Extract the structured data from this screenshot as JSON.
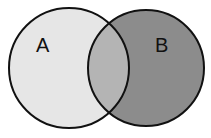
{
  "diagram": {
    "type": "venn",
    "sets": [
      {
        "label": "A",
        "fill": "#e6e6e6"
      },
      {
        "label": "B",
        "fill": "#8c8c8c"
      }
    ],
    "intersection_fill": "#b4b4b4",
    "stroke": "#111111"
  }
}
